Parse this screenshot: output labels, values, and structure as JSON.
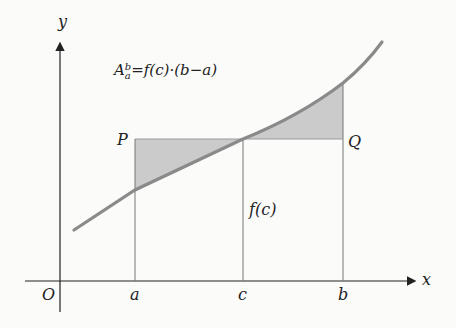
{
  "diagram": {
    "formula": {
      "base": "A",
      "sup": "b",
      "sub": "a",
      "rhs": "=f(c)·(b−a)"
    },
    "axes": {
      "x_label": "x",
      "y_label": "y",
      "origin_label": "O"
    },
    "points": {
      "P": "P",
      "Q": "Q"
    },
    "ticks": {
      "a": "a",
      "c": "c",
      "b": "b"
    },
    "fc_label": "f(c)",
    "colors": {
      "curve": "#8a8a8a",
      "shade": "#c9c9c9",
      "axis": "#222222",
      "line": "#666666"
    }
  }
}
